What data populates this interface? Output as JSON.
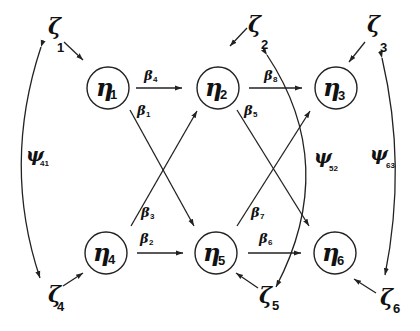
{
  "diagram": {
    "title": "",
    "nodes": [
      {
        "id": "eta1",
        "symbol": "η",
        "sub": "1",
        "cx": 108,
        "cy": 88
      },
      {
        "id": "eta2",
        "symbol": "η",
        "sub": "2",
        "cx": 218,
        "cy": 88
      },
      {
        "id": "eta3",
        "symbol": "η",
        "sub": "3",
        "cx": 336,
        "cy": 88
      },
      {
        "id": "eta4",
        "symbol": "η",
        "sub": "4",
        "cx": 106,
        "cy": 253
      },
      {
        "id": "eta5",
        "symbol": "η",
        "sub": "5",
        "cx": 216,
        "cy": 253
      },
      {
        "id": "eta6",
        "symbol": "η",
        "sub": "6",
        "cx": 335,
        "cy": 253
      }
    ],
    "disturbances": [
      {
        "id": "zeta1",
        "symbol": "ζ",
        "sub": "1",
        "x": 48,
        "y": 38
      },
      {
        "id": "zeta2",
        "symbol": "ζ",
        "sub": "2",
        "x": 248,
        "y": 38
      },
      {
        "id": "zeta3",
        "symbol": "ζ",
        "sub": "3",
        "x": 368,
        "y": 38
      },
      {
        "id": "zeta4",
        "symbol": "ζ",
        "sub": "4",
        "x": 48,
        "y": 303
      },
      {
        "id": "zeta5",
        "symbol": "ζ",
        "sub": "5",
        "x": 260,
        "y": 303
      },
      {
        "id": "zeta6",
        "symbol": "ζ",
        "sub": "6",
        "x": 380,
        "y": 303
      }
    ],
    "paths": [
      {
        "id": "beta4",
        "symbol": "β",
        "sub": "4",
        "from": "eta1",
        "to": "eta2",
        "lx": 146,
        "ly": 79
      },
      {
        "id": "beta1",
        "symbol": "β",
        "sub": "1",
        "from": "eta1",
        "to": "eta5",
        "lx": 139,
        "ly": 114
      },
      {
        "id": "beta3",
        "symbol": "β",
        "sub": "3",
        "from": "eta4",
        "to": "eta2",
        "lx": 143,
        "ly": 215
      },
      {
        "id": "beta2",
        "symbol": "β",
        "sub": "2",
        "from": "eta4",
        "to": "eta5",
        "lx": 141,
        "ly": 241
      },
      {
        "id": "beta8",
        "symbol": "β",
        "sub": "8",
        "from": "eta2",
        "to": "eta3",
        "lx": 265,
        "ly": 79
      },
      {
        "id": "beta5",
        "symbol": "β",
        "sub": "5",
        "from": "eta2",
        "to": "eta6",
        "lx": 245,
        "ly": 114
      },
      {
        "id": "beta7",
        "symbol": "β",
        "sub": "7",
        "from": "eta5",
        "to": "eta3",
        "lx": 252,
        "ly": 215
      },
      {
        "id": "beta6",
        "symbol": "β",
        "sub": "6",
        "from": "eta5",
        "to": "eta6",
        "lx": 259,
        "ly": 241
      }
    ],
    "covariances": [
      {
        "id": "psi41",
        "symbol": "ψ",
        "sub": "41",
        "between": [
          "zeta1",
          "zeta4"
        ],
        "lx": 28,
        "ly": 164
      },
      {
        "id": "psi52",
        "symbol": "ψ",
        "sub": "52",
        "between": [
          "zeta2",
          "zeta5"
        ],
        "lx": 318,
        "ly": 164
      },
      {
        "id": "psi63",
        "symbol": "ψ",
        "sub": "63",
        "between": [
          "zeta3",
          "zeta6"
        ],
        "lx": 373,
        "ly": 164
      }
    ]
  }
}
